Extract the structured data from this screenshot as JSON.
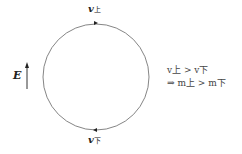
{
  "diagram": {
    "field_label": "E",
    "top_velocity": {
      "symbol": "v",
      "subscript": "上"
    },
    "bottom_velocity": {
      "symbol": "v",
      "subscript": "下"
    },
    "relations": {
      "line1": "v上 > v下",
      "line2": "⇒ m上 > m下"
    },
    "colors": {
      "line": "#555555",
      "text": "#222222"
    }
  }
}
